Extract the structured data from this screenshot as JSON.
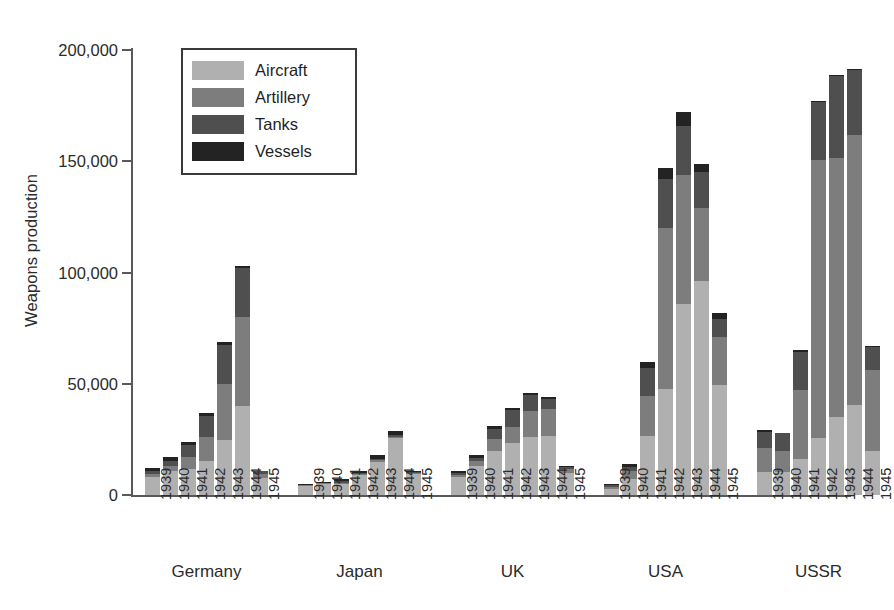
{
  "chart_data": {
    "type": "bar",
    "subtype": "stacked-bar-grouped",
    "title": "",
    "xlabel": "",
    "ylabel": "Weapons production",
    "ylim": [
      0,
      210000
    ],
    "yticks": [
      0,
      50000,
      100000,
      150000,
      200000
    ],
    "ytick_labels": [
      "0",
      "50,000",
      "100,000",
      "150,000",
      "200,000"
    ],
    "grid": false,
    "legend_position": "top-left-inside",
    "categories": [
      "1939",
      "1940",
      "1941",
      "1942",
      "1943",
      "1944",
      "1945"
    ],
    "groups": [
      "Germany",
      "Japan",
      "UK",
      "USA",
      "USSR"
    ],
    "series": [
      {
        "name": "Aircraft",
        "color": "#b0b0b0"
      },
      {
        "name": "Artillery",
        "color": "#7d7d7d"
      },
      {
        "name": "Tanks",
        "color": "#4f4f4f"
      },
      {
        "name": "Vessels",
        "color": "#232323"
      }
    ],
    "data": {
      "Germany": {
        "1939": {
          "Aircraft": 8300,
          "Artillery": 1200,
          "Tanks": 1300,
          "Vessels": 1200,
          "total": 12000
        },
        "1940": {
          "Aircraft": 10800,
          "Artillery": 2400,
          "Tanks": 2200,
          "Vessels": 1600,
          "total": 17000
        },
        "1941": {
          "Aircraft": 11800,
          "Artillery": 5400,
          "Tanks": 5300,
          "Vessels": 1500,
          "total": 24000
        },
        "1942": {
          "Aircraft": 15400,
          "Artillery": 10600,
          "Tanks": 9400,
          "Vessels": 1600,
          "total": 37000
        },
        "1943": {
          "Aircraft": 24800,
          "Artillery": 25200,
          "Tanks": 17500,
          "Vessels": 1500,
          "total": 69000
        },
        "1944": {
          "Aircraft": 39800,
          "Artillery": 40200,
          "Tanks": 22000,
          "Vessels": 1000,
          "total": 103000
        },
        "1945": {
          "Aircraft": 7500,
          "Artillery": 1800,
          "Tanks": 1500,
          "Vessels": 200,
          "total": 11000
        }
      },
      "Japan": {
        "1939": {
          "Aircraft": 4000,
          "Artillery": 300,
          "Tanks": 300,
          "Vessels": 400,
          "total": 5000
        },
        "1940": {
          "Aircraft": 4800,
          "Artillery": 400,
          "Tanks": 400,
          "Vessels": 400,
          "total": 6000
        },
        "1941": {
          "Aircraft": 5100,
          "Artillery": 500,
          "Tanks": 600,
          "Vessels": 800,
          "total": 7000
        },
        "1942": {
          "Aircraft": 8800,
          "Artillery": 500,
          "Tanks": 600,
          "Vessels": 1100,
          "total": 11000
        },
        "1943": {
          "Aircraft": 15000,
          "Artillery": 600,
          "Tanks": 700,
          "Vessels": 1700,
          "total": 18000
        },
        "1944": {
          "Aircraft": 25500,
          "Artillery": 800,
          "Tanks": 500,
          "Vessels": 2200,
          "total": 29000
        },
        "1945": {
          "Aircraft": 9500,
          "Artillery": 400,
          "Tanks": 300,
          "Vessels": 800,
          "total": 11000
        }
      },
      "UK": {
        "1939": {
          "Aircraft": 7900,
          "Artillery": 1100,
          "Tanks": 1000,
          "Vessels": 1000,
          "total": 11000
        },
        "1940": {
          "Aircraft": 13000,
          "Artillery": 2200,
          "Tanks": 1500,
          "Vessels": 1300,
          "total": 18000
        },
        "1941": {
          "Aircraft": 20000,
          "Artillery": 5400,
          "Tanks": 4400,
          "Vessels": 1200,
          "total": 31000
        },
        "1942": {
          "Aircraft": 23600,
          "Artillery": 6800,
          "Tanks": 7600,
          "Vessels": 1000,
          "total": 39000
        },
        "1943": {
          "Aircraft": 26200,
          "Artillery": 11400,
          "Tanks": 7500,
          "Vessels": 900,
          "total": 46000
        },
        "1944": {
          "Aircraft": 26500,
          "Artillery": 12300,
          "Tanks": 4500,
          "Vessels": 700,
          "total": 44000
        },
        "1945": {
          "Aircraft": 9900,
          "Artillery": 1900,
          "Tanks": 1000,
          "Vessels": 200,
          "total": 13000
        }
      },
      "USA": {
        "1939": {
          "Aircraft": 2900,
          "Artillery": 900,
          "Tanks": 600,
          "Vessels": 600,
          "total": 5000
        },
        "1940": {
          "Aircraft": 7400,
          "Artillery": 3200,
          "Tanks": 2000,
          "Vessels": 1400,
          "total": 14000
        },
        "1941": {
          "Aircraft": 26500,
          "Artillery": 18000,
          "Tanks": 12500,
          "Vessels": 3000,
          "total": 60000
        },
        "1942": {
          "Aircraft": 47800,
          "Artillery": 72200,
          "Tanks": 22000,
          "Vessels": 5000,
          "total": 147000
        },
        "1943": {
          "Aircraft": 85700,
          "Artillery": 58300,
          "Tanks": 22000,
          "Vessels": 6000,
          "total": 172000
        },
        "1944": {
          "Aircraft": 96000,
          "Artillery": 33000,
          "Tanks": 16000,
          "Vessels": 4000,
          "total": 149000
        },
        "1945": {
          "Aircraft": 49500,
          "Artillery": 21500,
          "Tanks": 8000,
          "Vessels": 3000,
          "total": 82000
        }
      },
      "USSR": {
        "1939": {
          "Aircraft": 10500,
          "Artillery": 10500,
          "Tanks": 7500,
          "Vessels": 500,
          "total": 29000
        },
        "1940": {
          "Aircraft": 10400,
          "Artillery": 9600,
          "Tanks": 7700,
          "Vessels": 300,
          "total": 28000
        },
        "1941": {
          "Aircraft": 16000,
          "Artillery": 31000,
          "Tanks": 17500,
          "Vessels": 500,
          "total": 65000
        },
        "1942": {
          "Aircraft": 25500,
          "Artillery": 125000,
          "Tanks": 26000,
          "Vessels": 500,
          "total": 177000
        },
        "1943": {
          "Aircraft": 35000,
          "Artillery": 116500,
          "Tanks": 37000,
          "Vessels": 500,
          "total": 189000
        },
        "1944": {
          "Aircraft": 40500,
          "Artillery": 121500,
          "Tanks": 29000,
          "Vessels": 500,
          "total": 191500
        },
        "1945": {
          "Aircraft": 20000,
          "Artillery": 36000,
          "Tanks": 10500,
          "Vessels": 500,
          "total": 67000
        }
      }
    }
  },
  "legend": {
    "items": [
      {
        "label": "Aircraft"
      },
      {
        "label": "Artillery"
      },
      {
        "label": "Tanks"
      },
      {
        "label": "Vessels"
      }
    ]
  }
}
